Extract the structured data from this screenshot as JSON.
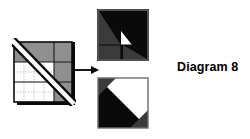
{
  "figure": {
    "caption": "Diagram 8",
    "arrow_label": "becomes",
    "colors": {
      "background": "#ffffff",
      "black": "#0a0a0a",
      "dark_gray": "#3b3b3b",
      "mid_gray": "#8f8f8f",
      "light_gray": "#b9b9b9",
      "white": "#ffffff",
      "outline": "#000000",
      "dashed_line": "#4a4a4a"
    },
    "panels": [
      {
        "id": "source-block",
        "name": "pieced-square-with-diagonal-ruler",
        "description": "Square patchwork unit shown with a white diagonal ruler band laid corner to corner, marked with dashed cutting lines.",
        "regions": [
          {
            "name": "top-band",
            "fill": "#8f8f8f"
          },
          {
            "name": "right-column",
            "fill": "#8f8f8f"
          },
          {
            "name": "lower-left-field",
            "fill": "#ffffff"
          },
          {
            "name": "lower-right-patch",
            "fill": "#8f8f8f"
          },
          {
            "name": "ruler-band",
            "fill": "#ffffff"
          }
        ]
      },
      {
        "id": "result-top",
        "name": "half-square-triangle-unit-a",
        "description": "Resulting square: black upper-right triangle field, dark gray corner triangles, a small white triangle at center and a gray quarter at lower left.",
        "regions": [
          {
            "name": "field",
            "fill": "#0a0a0a"
          },
          {
            "name": "upper-left-triangle",
            "fill": "#3b3b3b"
          },
          {
            "name": "lower-left-quarter",
            "fill": "#3b3b3b"
          },
          {
            "name": "lower-right-triangle",
            "fill": "#3b3b3b"
          },
          {
            "name": "center-white-triangle",
            "fill": "#ffffff"
          }
        ]
      },
      {
        "id": "result-bottom",
        "name": "half-square-triangle-unit-b",
        "description": "Resulting square: black lower-left triangle, white upper-right triangle, dark gray corner triangles top-left and bottom-right.",
        "regions": [
          {
            "name": "field-black",
            "fill": "#0a0a0a"
          },
          {
            "name": "upper-right-white",
            "fill": "#ffffff"
          },
          {
            "name": "top-left-corner-triangle",
            "fill": "#3b3b3b"
          },
          {
            "name": "bottom-right-corner-triangle",
            "fill": "#3b3b3b"
          }
        ]
      }
    ]
  }
}
